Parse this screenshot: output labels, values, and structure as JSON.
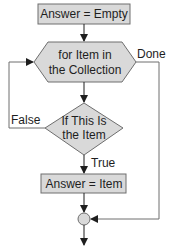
{
  "diagram": {
    "type": "flowchart",
    "colors": {
      "shape_fill": "#d9d9d9",
      "stroke": "#6e6e6e",
      "text": "#1e1e1e",
      "background": "#ffffff"
    },
    "nodes": {
      "start": {
        "shape": "rectangle",
        "text": "Answer = Empty"
      },
      "loop": {
        "shape": "hexagon",
        "line1": "for Item in",
        "line2": "the Collection"
      },
      "decision": {
        "shape": "diamond",
        "line1": "If This Is",
        "line2": "the Item"
      },
      "assign": {
        "shape": "rectangle",
        "text": "Answer = Item"
      },
      "join": {
        "shape": "circle"
      }
    },
    "edge_labels": {
      "done": "Done",
      "false": "False",
      "true": "True"
    }
  }
}
